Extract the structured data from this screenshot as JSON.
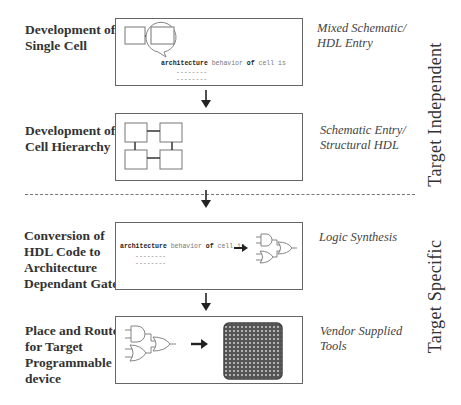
{
  "steps": [
    {
      "label_line1": "Development of",
      "label_line2": "Single Cell",
      "tool_line1": "Mixed Schematic/",
      "tool_line2": "HDL Entry"
    },
    {
      "label_line1": "Development of",
      "label_line2": "Cell Hierarchy",
      "tool_line1": "Schematic Entry/",
      "tool_line2": "Structural HDL"
    },
    {
      "label_line1": "Conversion of",
      "label_line2": "HDL Code to",
      "label_line3": "Architecture",
      "label_line4": "Dependant Gates",
      "tool_line1": "Logic Synthesis"
    },
    {
      "label_line1": "Place and Route",
      "label_line2": "for Target",
      "label_line3": "Programmable",
      "label_line4": "device",
      "tool_line1": "Vendor Supplied",
      "tool_line2": "Tools"
    }
  ],
  "code_snippet": {
    "kw_architecture": "architecture",
    "behavior": "behavior",
    "kw_of": "of",
    "cell_is": "cell is",
    "dash_line": "--------"
  },
  "phases": {
    "independent": "Target  Independent",
    "specific": "Target Specific"
  },
  "colors": {
    "border": "#666666",
    "arrow": "#222222",
    "chip": "#555555",
    "dashed_divider": "#777777"
  }
}
